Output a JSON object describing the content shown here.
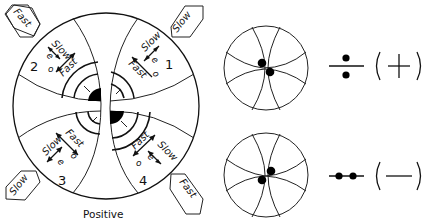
{
  "figure": {
    "main_diagram": {
      "caption": "Positive",
      "quadrants": [
        {
          "number": "1",
          "slow_label": "Slow",
          "e_label": "e",
          "fast_label": "Fast",
          "o_label": "o"
        },
        {
          "number": "2",
          "slow_label": "Slow",
          "e_label": "e",
          "fast_label": "Fast",
          "o_label": "o"
        },
        {
          "number": "3",
          "slow_label": "Slow",
          "e_label": "e",
          "fast_label": "Fast",
          "o_label": "o"
        },
        {
          "number": "4",
          "slow_label": "Slow",
          "e_label": "e",
          "fast_label": "Fast",
          "o_label": "o"
        }
      ],
      "corner_tags": {
        "top_left": "Fast",
        "top_right": "Slow",
        "bottom_left": "Slow",
        "bottom_right": "Fast"
      }
    },
    "small_figures": [
      {
        "id": "upper",
        "sign": "(+)",
        "sign_symbol": "+"
      },
      {
        "id": "lower",
        "sign": "(—)",
        "sign_symbol": "—"
      }
    ],
    "colors": {
      "ink": "#111111",
      "background": "#ffffff"
    }
  }
}
